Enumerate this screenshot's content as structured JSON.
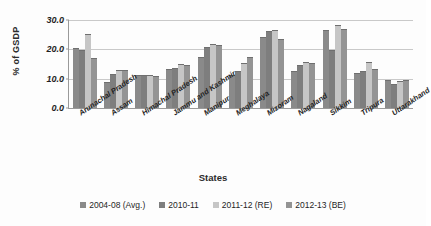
{
  "chart_data": {
    "type": "bar",
    "title": "",
    "xlabel": "States",
    "ylabel": "% of GSDP",
    "ylim": [
      0,
      30
    ],
    "yticks": [
      "0.0",
      "10.0",
      "20.0",
      "30.0"
    ],
    "ytick_values": [
      0,
      10,
      20,
      30
    ],
    "grid": true,
    "legend_position": "bottom",
    "categories": [
      "Arunachal Pradesh",
      "Assam",
      "Himachal Pradesh",
      "Jammu and Kashmir",
      "Manipur",
      "Meghalaya",
      "Mizoram",
      "Nagaland",
      "Sikkim",
      "Tripura",
      "Uttarakhand"
    ],
    "series": [
      {
        "name": "2004-08 (Avg.)",
        "color": "#8a8a8a",
        "values": [
          20.0,
          8.4,
          10.8,
          13.1,
          17.0,
          10.8,
          23.9,
          12.3,
          26.1,
          11.5,
          9.1
        ]
      },
      {
        "name": "2010-11",
        "color": "#7e7e7e",
        "values": [
          19.6,
          11.4,
          11.0,
          13.4,
          20.3,
          12.2,
          25.9,
          14.2,
          19.4,
          12.2,
          8.0
        ]
      },
      {
        "name": "2011-12 (RE)",
        "color": "#c6c6c6",
        "values": [
          25.0,
          12.7,
          10.8,
          14.6,
          21.6,
          15.1,
          26.1,
          15.4,
          27.9,
          15.2,
          8.8
        ]
      },
      {
        "name": "2012-13 (BE)",
        "color": "#949494",
        "values": [
          16.6,
          12.7,
          10.7,
          14.3,
          21.2,
          17.2,
          23.2,
          14.9,
          26.5,
          13.1,
          9.3
        ]
      }
    ]
  }
}
